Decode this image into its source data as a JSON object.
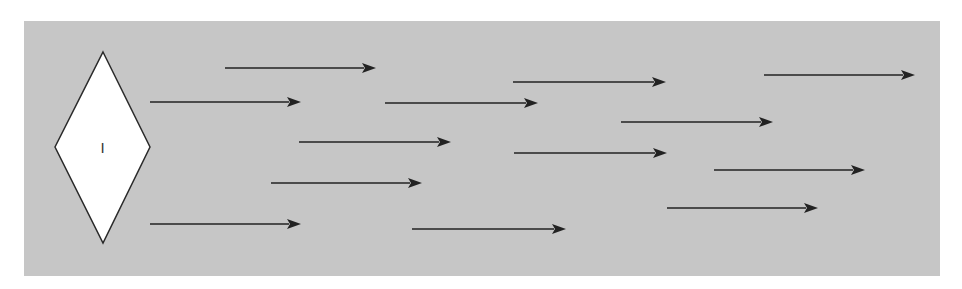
{
  "diagram": {
    "background": {
      "x": 24,
      "y": 21,
      "width": 916,
      "height": 255,
      "color": "#c6c6c6"
    },
    "diamond": {
      "label": "I",
      "points": {
        "top": [
          103,
          52
        ],
        "right": [
          150,
          147
        ],
        "bottom": [
          103,
          243
        ],
        "left": [
          55,
          147
        ]
      },
      "fill": "#ffffff"
    },
    "arrows": [
      {
        "x1": 225,
        "y1": 68,
        "x2": 376,
        "y2": 68
      },
      {
        "x1": 150,
        "y1": 102,
        "x2": 301,
        "y2": 102
      },
      {
        "x1": 385,
        "y1": 103,
        "x2": 538,
        "y2": 103
      },
      {
        "x1": 513,
        "y1": 82,
        "x2": 666,
        "y2": 82
      },
      {
        "x1": 764,
        "y1": 75,
        "x2": 915,
        "y2": 75
      },
      {
        "x1": 299,
        "y1": 142,
        "x2": 451,
        "y2": 142
      },
      {
        "x1": 514,
        "y1": 153,
        "x2": 667,
        "y2": 153
      },
      {
        "x1": 621,
        "y1": 122,
        "x2": 773,
        "y2": 122
      },
      {
        "x1": 271,
        "y1": 183,
        "x2": 422,
        "y2": 183
      },
      {
        "x1": 714,
        "y1": 170,
        "x2": 865,
        "y2": 170
      },
      {
        "x1": 150,
        "y1": 224,
        "x2": 301,
        "y2": 224
      },
      {
        "x1": 412,
        "y1": 229,
        "x2": 566,
        "y2": 229
      },
      {
        "x1": 667,
        "y1": 208,
        "x2": 818,
        "y2": 208
      }
    ],
    "arrow_color": "#222222"
  }
}
